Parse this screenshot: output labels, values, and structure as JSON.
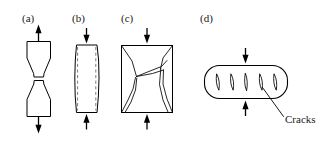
{
  "figure": {
    "width": 326,
    "height": 153,
    "background_color": "#ffffff",
    "line_color": "#000000",
    "ghost_line_color": "#7d7d7d"
  },
  "panels": [
    {
      "id": "a",
      "label": "(a)",
      "meaning": "tensile-cup-and-cone-fracture",
      "loading": "tension",
      "arrow_direction": "outward"
    },
    {
      "id": "b",
      "label": "(b)",
      "meaning": "compression-barrelling-ductile",
      "loading": "compression",
      "arrow_direction": "inward"
    },
    {
      "id": "c",
      "label": "(c)",
      "meaning": "compression-shear-cone-fracture",
      "loading": "compression",
      "arrow_direction": "inward"
    },
    {
      "id": "d",
      "label": "(d)",
      "meaning": "compression-internal-cracking",
      "loading": "compression",
      "arrow_direction": "inward"
    }
  ],
  "annotations": [
    {
      "id": "cracks",
      "text": "Cracks",
      "panel": "d",
      "has_leader_line": true
    }
  ],
  "crack_count_panel_d": 5
}
